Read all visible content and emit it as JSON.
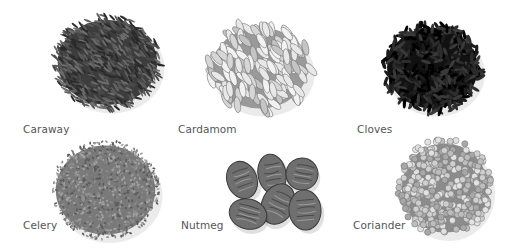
{
  "spices": [
    {
      "name": "Caraway",
      "tone": "dark-grey seeds"
    },
    {
      "name": "Cardamom",
      "tone": "light oval pods"
    },
    {
      "name": "Cloves",
      "tone": "black buds"
    },
    {
      "name": "Celery",
      "tone": "grey fine seeds"
    },
    {
      "name": "Nutmeg",
      "tone": "mid-grey nuts"
    },
    {
      "name": "Coriander",
      "tone": "light round seeds"
    }
  ],
  "colors": {
    "background": "#ffffff",
    "label": "#555555"
  }
}
